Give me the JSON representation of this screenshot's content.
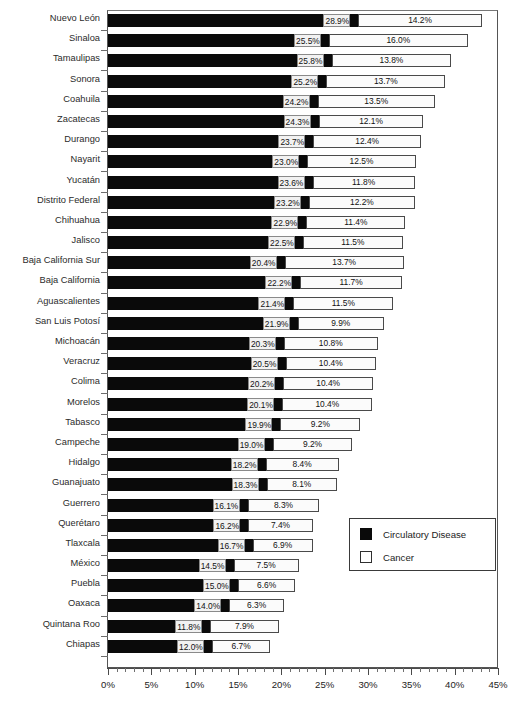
{
  "chart_data": {
    "type": "bar",
    "orientation": "horizontal",
    "stacked": true,
    "title": "",
    "xlabel": "",
    "ylabel": "",
    "xlim": [
      0,
      45
    ],
    "xtick_labels": [
      "0%",
      "5%",
      "10%",
      "15%",
      "20%",
      "25%",
      "30%",
      "35%",
      "40%",
      "45%"
    ],
    "xtick_values": [
      0,
      5,
      10,
      15,
      20,
      25,
      30,
      35,
      40,
      45
    ],
    "grid": false,
    "legend_position": "lower-right",
    "categories": [
      "Nuevo León",
      "Sinaloa",
      "Tamaulipas",
      "Sonora",
      "Coahuila",
      "Zacatecas",
      "Durango",
      "Nayarit",
      "Yucatán",
      "Distrito Federal",
      "Chihuahua",
      "Jalisco",
      "Baja California Sur",
      "Baja California",
      "Aguascalientes",
      "San Luis Potosí",
      "Michoacán",
      "Veracruz",
      "Colima",
      "Morelos",
      "Tabasco",
      "Campeche",
      "Hidalgo",
      "Guanajuato",
      "Guerrero",
      "Querétaro",
      "Tlaxcala",
      "México",
      "Puebla",
      "Oaxaca",
      "Quintana Roo",
      "Chiapas"
    ],
    "series": [
      {
        "name": "Circulatory Disease",
        "color": "#0a0a0a",
        "values": [
          28.9,
          25.5,
          25.8,
          25.2,
          24.2,
          24.3,
          23.7,
          23.0,
          23.6,
          23.2,
          22.9,
          22.5,
          20.4,
          22.2,
          21.4,
          21.9,
          20.3,
          20.5,
          20.2,
          20.1,
          19.9,
          19.0,
          18.2,
          18.3,
          16.1,
          16.2,
          16.7,
          14.5,
          15.0,
          14.0,
          11.8,
          12.0
        ],
        "labels": [
          "28.9%",
          "25.5%",
          "25.8%",
          "25.2%",
          "24.2%",
          "24.3%",
          "23.7%",
          "23.0%",
          "23.6%",
          "23.2%",
          "22.9%",
          "22.5%",
          "20.4%",
          "22.2%",
          "21.4%",
          "21.9%",
          "20.3%",
          "20.5%",
          "20.2%",
          "20.1%",
          "19.9%",
          "19.0%",
          "18.2%",
          "18.3%",
          "16.1%",
          "16.2%",
          "16.7%",
          "14.5%",
          "15.0%",
          "14.0%",
          "11.8%",
          "12.0%"
        ]
      },
      {
        "name": "Cancer",
        "color": "#ffffff",
        "values": [
          14.2,
          16.0,
          13.8,
          13.7,
          13.5,
          12.1,
          12.4,
          12.5,
          11.8,
          12.2,
          11.4,
          11.5,
          13.7,
          11.7,
          11.5,
          9.9,
          10.8,
          10.4,
          10.4,
          10.4,
          9.2,
          9.2,
          8.4,
          8.1,
          8.3,
          7.4,
          6.9,
          7.5,
          6.6,
          6.3,
          7.9,
          6.7
        ],
        "labels": [
          "14.2%",
          "16.0%",
          "13.8%",
          "13.7%",
          "13.5%",
          "12.1%",
          "12.4%",
          "12.5%",
          "11.8%",
          "12.2%",
          "11.4%",
          "11.5%",
          "13.7%",
          "11.7%",
          "11.5%",
          "9.9%",
          "10.8%",
          "10.4%",
          "10.4%",
          "10.4%",
          "9.2%",
          "9.2%",
          "8.4%",
          "8.1%",
          "8.3%",
          "7.4%",
          "6.9%",
          "7.5%",
          "6.6%",
          "6.3%",
          "7.9%",
          "6.7%"
        ]
      }
    ]
  },
  "legend": {
    "items": [
      {
        "label": "Circulatory Disease",
        "swatch": "filled-black-square"
      },
      {
        "label": "Cancer",
        "swatch": "outlined-white-square"
      }
    ]
  },
  "axis": {
    "x_ticks": [
      "0%",
      "5%",
      "10%",
      "15%",
      "20%",
      "25%",
      "30%",
      "35%",
      "40%",
      "45%"
    ]
  },
  "colors": {
    "series_a": "#0a0a0a",
    "series_b": "#ffffff",
    "outline": "#4a4a4a",
    "frame": "#555555",
    "label_bg": "#f2f2f2"
  }
}
